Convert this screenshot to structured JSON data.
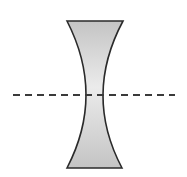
{
  "diagram": {
    "colors": {
      "background": "#ffffff",
      "lens_fill_light": "#ebebeb",
      "lens_fill_dark": "#c4c4c4",
      "outline": "#2a2a2a",
      "axis": "#3a3a3a"
    },
    "lens": {
      "top_y": 21,
      "bottom_y": 168,
      "top_left_x": 67,
      "top_right_x": 123,
      "bottom_left_x": 67,
      "bottom_right_x": 122,
      "waist_y": 95,
      "waist_left_x": 86,
      "waist_right_x": 103
    },
    "optical_axis": {
      "y": 95,
      "x_start": 13,
      "x_end": 175,
      "style": "dashed"
    }
  }
}
